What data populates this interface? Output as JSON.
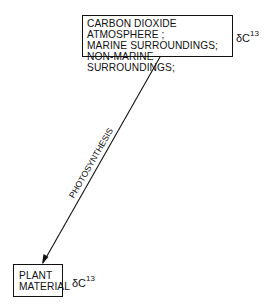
{
  "diagram": {
    "type": "flow",
    "source_node": {
      "lines": [
        "CARBON DIOXIDE",
        "ATMOSPHERE ;",
        "MARINE SURROUNDINGS;",
        "NON-MARINE SURROUNDINGS;"
      ],
      "annotation": {
        "symbol": "δC",
        "superscript": "13"
      }
    },
    "target_node": {
      "lines": [
        "PLANT",
        "MATERIAL"
      ],
      "annotation": {
        "symbol": "δC",
        "superscript": "13"
      }
    },
    "edge": {
      "label": "PHOTOSYNTHESIS",
      "from": "source_node",
      "to": "target_node",
      "arrow": "end"
    },
    "colors": {
      "stroke": "#111111",
      "background": "#ffffff"
    }
  }
}
